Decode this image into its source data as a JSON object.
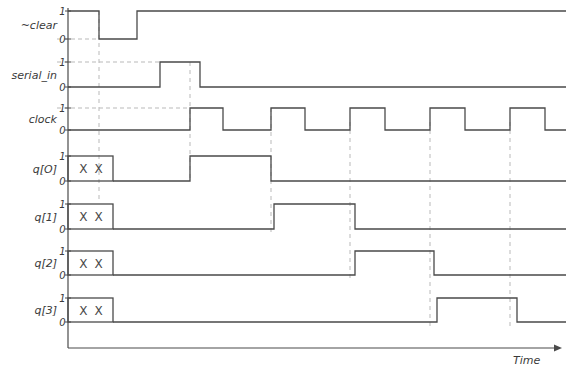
{
  "axis": {
    "time_label": "Time",
    "level_high": "1",
    "level_low": "0"
  },
  "colors": {
    "trace": "#4a4a4a",
    "axis": "#4a4a4a",
    "dashed": "#b9b9b9",
    "text": "#3a3a3a",
    "background": "#ffffff"
  },
  "signals": [
    {
      "name": "~clear",
      "label": "~clear",
      "high_y": 11,
      "low_y": 39,
      "unknown_box": null,
      "segments": [
        {
          "from": 68,
          "to": 99,
          "level": 1
        },
        {
          "from": 99,
          "to": 137,
          "level": 0
        },
        {
          "from": 137,
          "to": 566,
          "level": 1
        }
      ]
    },
    {
      "name": "serial_in",
      "label": "serial_in",
      "high_y": 62,
      "low_y": 87,
      "unknown_box": null,
      "segments": [
        {
          "from": 68,
          "to": 160,
          "level": 0
        },
        {
          "from": 160,
          "to": 200,
          "level": 1
        },
        {
          "from": 200,
          "to": 566,
          "level": 0
        }
      ]
    },
    {
      "name": "clock",
      "label": "clock",
      "high_y": 108,
      "low_y": 130,
      "unknown_box": null,
      "segments": [
        {
          "from": 68,
          "to": 190,
          "level": 0
        },
        {
          "from": 190,
          "to": 223,
          "level": 1
        },
        {
          "from": 223,
          "to": 271,
          "level": 0
        },
        {
          "from": 271,
          "to": 305,
          "level": 1
        },
        {
          "from": 305,
          "to": 350,
          "level": 0
        },
        {
          "from": 350,
          "to": 385,
          "level": 1
        },
        {
          "from": 385,
          "to": 430,
          "level": 0
        },
        {
          "from": 430,
          "to": 465,
          "level": 1
        },
        {
          "from": 465,
          "to": 510,
          "level": 0
        },
        {
          "from": 510,
          "to": 545,
          "level": 1
        },
        {
          "from": 545,
          "to": 566,
          "level": 0
        }
      ]
    },
    {
      "name": "q[0]",
      "label": "q[O]",
      "high_y": 156,
      "low_y": 181,
      "unknown_box": {
        "x": 68,
        "width": 45,
        "text_left": "X",
        "text_right": "X"
      },
      "segments": [
        {
          "from": 113,
          "to": 190,
          "level": 0
        },
        {
          "from": 190,
          "to": 271,
          "level": 1
        },
        {
          "from": 271,
          "to": 566,
          "level": 0
        }
      ]
    },
    {
      "name": "q[1]",
      "label": "q[1]",
      "high_y": 204,
      "low_y": 229,
      "unknown_box": {
        "x": 68,
        "width": 45,
        "text_left": "X",
        "text_right": "X"
      },
      "segments": [
        {
          "from": 113,
          "to": 274,
          "level": 0
        },
        {
          "from": 274,
          "to": 355,
          "level": 1
        },
        {
          "from": 355,
          "to": 566,
          "level": 0
        }
      ]
    },
    {
      "name": "q[2]",
      "label": "q[2]",
      "high_y": 251,
      "low_y": 275,
      "unknown_box": {
        "x": 68,
        "width": 45,
        "text_left": "X",
        "text_right": "X"
      },
      "segments": [
        {
          "from": 113,
          "to": 355,
          "level": 0
        },
        {
          "from": 355,
          "to": 434,
          "level": 1
        },
        {
          "from": 434,
          "to": 566,
          "level": 0
        }
      ]
    },
    {
      "name": "q[3]",
      "label": "q[3]",
      "high_y": 298,
      "low_y": 322,
      "unknown_box": {
        "x": 68,
        "width": 45,
        "text_left": "X",
        "text_right": "X"
      },
      "segments": [
        {
          "from": 113,
          "to": 437,
          "level": 0
        },
        {
          "from": 437,
          "to": 517,
          "level": 1
        },
        {
          "from": 517,
          "to": 566,
          "level": 0
        }
      ]
    }
  ],
  "dashed_markers": [
    {
      "x": 99,
      "y_top": 11,
      "y_bottom": 200
    },
    {
      "x": 190,
      "y_top": 62,
      "y_bottom": 182
    },
    {
      "x": 271,
      "y_top": 108,
      "y_bottom": 232
    },
    {
      "x": 350,
      "y_top": 122,
      "y_bottom": 278
    },
    {
      "x": 430,
      "y_top": 122,
      "y_bottom": 326
    },
    {
      "x": 510,
      "y_top": 122,
      "y_bottom": 326
    }
  ],
  "dashed_levels": [
    {
      "y": 39,
      "x_from": 57,
      "x_to": 99
    },
    {
      "y": 62,
      "x_from": 57,
      "x_to": 160
    },
    {
      "y": 108,
      "x_from": 57,
      "x_to": 190
    }
  ],
  "axes": {
    "v_axis_x": 68,
    "v_axis_top": 8,
    "v_axis_bottom": 348,
    "h_axis_y": 348,
    "h_axis_from": 68,
    "h_axis_to": 556,
    "time_label_x": 513,
    "time_label_y": 364
  }
}
